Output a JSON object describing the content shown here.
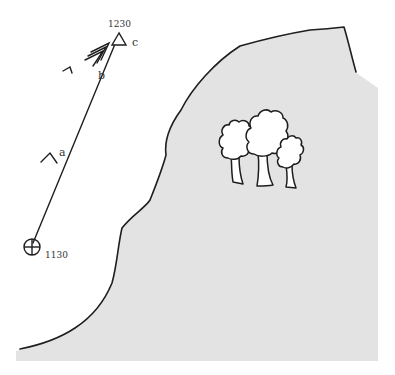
{
  "diagram": {
    "colors": {
      "hill_fill": "#e3e3e3",
      "line": "#1e1e1e",
      "background": "#ffffff"
    },
    "start_point": {
      "symbol": "circle-cross",
      "time_label": "1130"
    },
    "end_point": {
      "symbol": "triangle",
      "time_label": "1230",
      "label": "c"
    },
    "legs": [
      {
        "label": "a",
        "arrow_heads": 1
      },
      {
        "label": "b",
        "arrow_heads": 3
      }
    ],
    "landmarks": [
      {
        "type": "hill",
        "feature": "trees",
        "tree_count": 3
      }
    ]
  }
}
